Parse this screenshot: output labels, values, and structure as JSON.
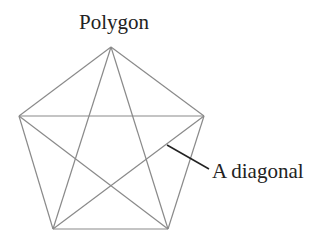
{
  "title": "Polygon",
  "annotation": {
    "label": "A diagonal"
  },
  "colors": {
    "edge": "#8a8a8a",
    "leader": "#222222",
    "text": "#222222",
    "background": "#ffffff"
  },
  "polygon": {
    "sides": 5,
    "vertices": [
      [
        111,
        47
      ],
      [
        204,
        116
      ],
      [
        168,
        229
      ],
      [
        53,
        229
      ],
      [
        19,
        116
      ]
    ]
  }
}
